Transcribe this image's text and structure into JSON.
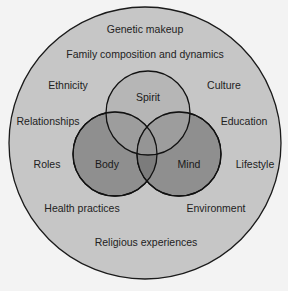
{
  "diagram": {
    "type": "nested-venn",
    "outer_circle": {
      "fill": "#c4c4c4",
      "stroke": "#1a1a1a",
      "labels": [
        "Genetic makeup",
        "Family composition and dynamics",
        "Ethnicity",
        "Culture",
        "Relationships",
        "Education",
        "Roles",
        "Lifestyle",
        "Health practices",
        "Environment",
        "Religious experiences"
      ]
    },
    "inner_circles": [
      {
        "label": "Spirit",
        "fill": "#a8a8a8"
      },
      {
        "label": "Body",
        "fill": "#8e8e8e"
      },
      {
        "label": "Mind",
        "fill": "#8e8e8e"
      }
    ]
  }
}
